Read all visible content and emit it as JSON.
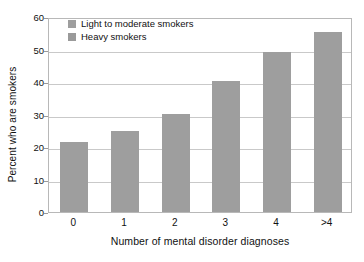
{
  "chart_data": {
    "type": "bar",
    "title": "",
    "subtitle": "",
    "xlabel": "Number of mental disorder diagnoses",
    "ylabel": "Percent who are smokers",
    "categories": [
      "0",
      "1",
      "2",
      "3",
      "4",
      ">4"
    ],
    "series": [
      {
        "name": "Light to moderate smokers",
        "color": "#9e9e9e",
        "values": [
          21.4,
          25.0,
          30.1,
          40.2,
          49.3,
          55.3
        ]
      },
      {
        "name": "Heavy smokers",
        "color": "#9a9a9a",
        "values": [
          0,
          0,
          0,
          0,
          0,
          0
        ]
      }
    ],
    "values": [
      21.4,
      25.0,
      30.1,
      40.2,
      49.3,
      55.3
    ],
    "ylim": [
      0,
      60
    ],
    "yticks": [
      0,
      10,
      20,
      30,
      40,
      50,
      60
    ],
    "ytick_labels": [
      "0",
      "10",
      "20",
      "30",
      "40",
      "50",
      "60"
    ],
    "grid": true,
    "grid_axis": "y",
    "legend_position": "top-left",
    "bar_color": "#9a9a9a",
    "frame_color": "#b8b8b8",
    "gridline_color": "#c9c9c9",
    "background": "#ffffff"
  },
  "legend": {
    "entries": [
      {
        "label": "Light to moderate smokers",
        "swatch": "#9e9e9e"
      },
      {
        "label": "Heavy smokers",
        "swatch": "#9a9a9a"
      }
    ]
  },
  "axes": {
    "y_title": "Percent who are smokers",
    "x_title": "Number of mental disorder diagnoses"
  }
}
